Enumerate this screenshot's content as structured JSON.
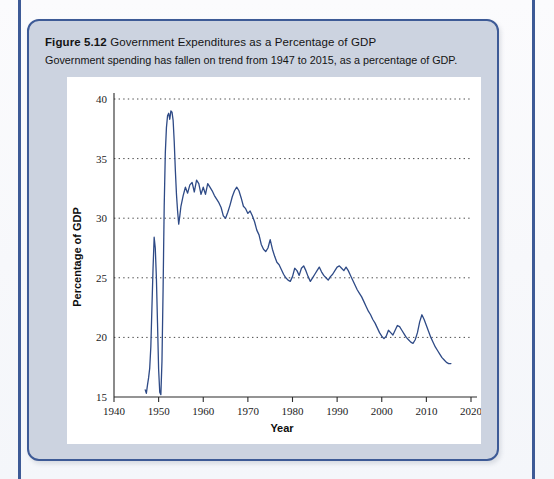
{
  "page": {
    "background_color": "#f7f8fb",
    "rule_color": "#3d5a96"
  },
  "figure": {
    "label": "Figure 5.12",
    "title": "Government Expenditures as a Percentage of GDP",
    "subtitle": "Government spending has fallen on trend from 1947 to 2015, as a percentage of GDP.",
    "card_background": "#ccd3e0",
    "card_border_color": "#3d5a96",
    "panel_background": "#ffffff"
  },
  "chart_data": {
    "type": "line",
    "title": "Government Expenditures as a Percentage of GDP",
    "subtitle": "Government spending has fallen on trend from 1947 to 2015, as a percentage of GDP.",
    "xlabel": "Year",
    "ylabel": "Percentage of GDP",
    "xlim": [
      1940,
      2020
    ],
    "ylim": [
      15,
      40
    ],
    "xticks": [
      1940,
      1950,
      1960,
      1970,
      1980,
      1990,
      2000,
      2010,
      2020
    ],
    "yticks": [
      15,
      20,
      25,
      30,
      35,
      40
    ],
    "xtick_labels": [
      "1940",
      "1950",
      "1960",
      "1970",
      "1980",
      "1990",
      "2000",
      "2010",
      "2020"
    ],
    "ytick_labels": [
      "15",
      "20",
      "25",
      "30",
      "35",
      "40"
    ],
    "grid": true,
    "grid_style": "dotted",
    "grid_color": "#4a4a4a",
    "legend": false,
    "line_color": "#2e4a86",
    "line_width": 1.3,
    "series": [
      {
        "name": "Government Expenditures (% of GDP)",
        "x": [
          1947.0,
          1947.25,
          1947.5,
          1947.75,
          1948.0,
          1948.25,
          1948.5,
          1948.75,
          1949.0,
          1949.25,
          1949.5,
          1949.75,
          1950.0,
          1950.25,
          1950.5,
          1950.75,
          1951.0,
          1951.25,
          1951.5,
          1951.75,
          1952.0,
          1952.25,
          1952.5,
          1952.75,
          1953.0,
          1953.25,
          1953.5,
          1953.75,
          1954.0,
          1954.25,
          1954.5,
          1954.75,
          1955.0,
          1955.5,
          1956.0,
          1956.5,
          1957.0,
          1957.5,
          1958.0,
          1958.5,
          1959.0,
          1959.5,
          1960.0,
          1960.5,
          1961.0,
          1961.5,
          1962.0,
          1962.5,
          1963.0,
          1963.5,
          1964.0,
          1964.5,
          1965.0,
          1965.5,
          1966.0,
          1966.5,
          1967.0,
          1967.5,
          1968.0,
          1968.5,
          1969.0,
          1969.5,
          1970.0,
          1970.5,
          1971.0,
          1971.5,
          1972.0,
          1972.5,
          1973.0,
          1973.5,
          1974.0,
          1974.5,
          1975.0,
          1975.5,
          1976.0,
          1976.5,
          1977.0,
          1977.5,
          1978.0,
          1978.5,
          1979.0,
          1979.5,
          1980.0,
          1980.5,
          1981.0,
          1981.5,
          1982.0,
          1982.5,
          1983.0,
          1983.5,
          1984.0,
          1984.5,
          1985.0,
          1985.5,
          1986.0,
          1986.5,
          1987.0,
          1987.5,
          1988.0,
          1988.5,
          1989.0,
          1989.5,
          1990.0,
          1990.5,
          1991.0,
          1991.5,
          1992.0,
          1992.5,
          1993.0,
          1993.5,
          1994.0,
          1994.5,
          1995.0,
          1995.5,
          1996.0,
          1996.5,
          1997.0,
          1997.5,
          1998.0,
          1998.5,
          1999.0,
          1999.5,
          2000.0,
          2000.5,
          2001.0,
          2001.5,
          2002.0,
          2002.5,
          2003.0,
          2003.5,
          2004.0,
          2004.5,
          2005.0,
          2005.5,
          2006.0,
          2006.5,
          2007.0,
          2007.5,
          2008.0,
          2008.5,
          2009.0,
          2009.5,
          2010.0,
          2010.5,
          2011.0,
          2011.5,
          2012.0,
          2012.5,
          2013.0,
          2013.5,
          2014.0,
          2014.5,
          2015.0,
          2015.5
        ],
        "values": [
          15.6,
          15.3,
          16.0,
          16.6,
          17.4,
          19.2,
          22.5,
          25.8,
          28.4,
          27.5,
          25.0,
          21.2,
          17.3,
          15.4,
          15.2,
          18.0,
          24.0,
          31.0,
          35.5,
          37.6,
          38.6,
          38.8,
          38.3,
          39.0,
          38.9,
          38.2,
          36.4,
          34.0,
          32.0,
          30.6,
          29.5,
          30.2,
          31.0,
          31.9,
          32.6,
          32.1,
          32.8,
          33.0,
          32.2,
          33.2,
          32.9,
          32.0,
          32.6,
          32.0,
          32.9,
          32.6,
          32.3,
          31.9,
          31.6,
          31.3,
          30.9,
          30.2,
          30.0,
          30.5,
          31.1,
          31.8,
          32.3,
          32.6,
          32.3,
          31.7,
          31.0,
          30.8,
          30.4,
          30.6,
          30.2,
          29.7,
          29.0,
          28.6,
          27.8,
          27.4,
          27.2,
          27.5,
          28.2,
          27.4,
          26.8,
          26.3,
          26.1,
          25.7,
          25.3,
          25.0,
          24.8,
          24.7,
          25.1,
          25.8,
          25.6,
          25.2,
          25.8,
          26.0,
          25.6,
          25.1,
          24.7,
          25.0,
          25.3,
          25.6,
          25.9,
          25.5,
          25.2,
          25.0,
          24.8,
          25.1,
          25.3,
          25.6,
          25.9,
          26.0,
          25.8,
          25.6,
          25.9,
          25.6,
          25.2,
          24.8,
          24.4,
          24.0,
          23.7,
          23.4,
          23.0,
          22.6,
          22.2,
          21.9,
          21.5,
          21.2,
          20.8,
          20.4,
          20.1,
          19.9,
          20.1,
          20.6,
          20.4,
          20.2,
          20.6,
          21.0,
          20.9,
          20.6,
          20.3,
          20.0,
          19.8,
          19.6,
          19.5,
          19.8,
          20.4,
          21.3,
          21.9,
          21.5,
          21.0,
          20.5,
          20.0,
          19.6,
          19.2,
          18.9,
          18.6,
          18.3,
          18.1,
          17.9,
          17.8,
          17.8
        ]
      }
    ],
    "annotations": []
  }
}
